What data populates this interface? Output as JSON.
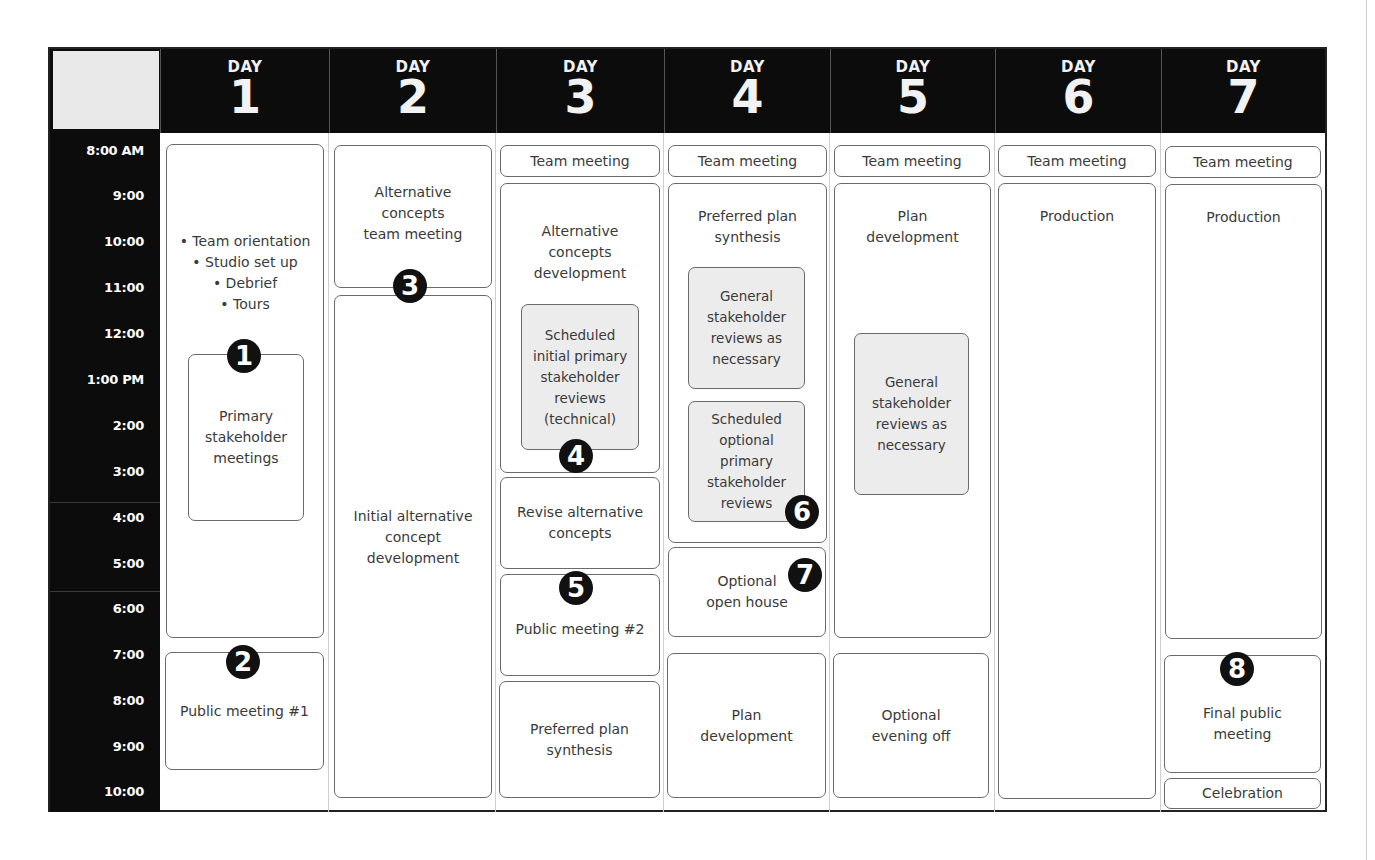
{
  "times": [
    "8:00 AM",
    "9:00",
    "10:00",
    "11:00",
    "12:00",
    "1:00 PM",
    "2:00",
    "3:00",
    "4:00",
    "5:00",
    "6:00",
    "7:00",
    "8:00",
    "9:00",
    "10:00"
  ],
  "days": [
    {
      "label": "DAY",
      "number": "1"
    },
    {
      "label": "DAY",
      "number": "2"
    },
    {
      "label": "DAY",
      "number": "3"
    },
    {
      "label": "DAY",
      "number": "4"
    },
    {
      "label": "DAY",
      "number": "5"
    },
    {
      "label": "DAY",
      "number": "6"
    },
    {
      "label": "DAY",
      "number": "7"
    }
  ],
  "events": {
    "d1_morning": "• Team orientation\n• Studio set up\n• Debrief\n• Tours",
    "d1_primary": "Primary\nstakeholder\nmeetings",
    "d1_public": "Public meeting #1",
    "d2_altteam": "Alternative\nconcepts\nteam meeting",
    "d2_initial": "Initial alternative\nconcept\ndevelopment",
    "d3_team": "Team meeting",
    "d3_altdev": "Alternative\nconcepts\ndevelopment",
    "d3_scheduled": "Scheduled\ninitial primary\nstakeholder\nreviews\n(technical)",
    "d3_revise": "Revise alternative\nconcepts",
    "d3_public2": "Public meeting #2",
    "d3_preferred": "Preferred plan\nsynthesis",
    "d4_team": "Team meeting",
    "d4_preferred": "Preferred plan\nsynthesis",
    "d4_general": "General\nstakeholder\nreviews as\nnecessary",
    "d4_optional_reviews": "Scheduled\noptional\nprimary\nstakeholder\nreviews",
    "d4_openhouse": "Optional\nopen house",
    "d4_plandev": "Plan\ndevelopment",
    "d5_team": "Team meeting",
    "d5_plandev": "Plan\ndevelopment",
    "d5_general": "General\nstakeholder\nreviews as\nnecessary",
    "d5_eveningoff": "Optional\nevening off",
    "d6_team": "Team meeting",
    "d6_production": "Production",
    "d7_team": "Team meeting",
    "d7_production": "Production",
    "d7_final": "Final public\nmeeting",
    "d7_celebration": "Celebration"
  },
  "badges": [
    "1",
    "2",
    "3",
    "4",
    "5",
    "6",
    "7",
    "8"
  ]
}
